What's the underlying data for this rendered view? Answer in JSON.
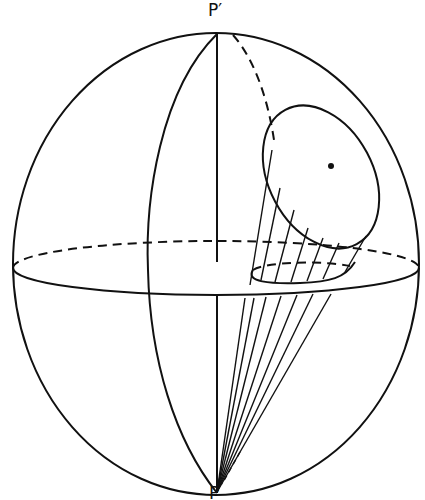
{
  "figure": {
    "type": "sphere-projection-diagram",
    "labels": {
      "top_pole": "P′",
      "bottom_pole": "P"
    },
    "elements": [
      "sphere-outline",
      "equator-plane-ellipse",
      "polar-axis",
      "meridian-left",
      "meridian-right-hidden",
      "spherical-cap-circle",
      "cap-center-point",
      "projected-circle-on-equator",
      "projection-lines-cap-to-equator",
      "projection-lines-from-pole-P"
    ],
    "colors": {
      "ink": "#111111",
      "background": "#ffffff"
    }
  }
}
